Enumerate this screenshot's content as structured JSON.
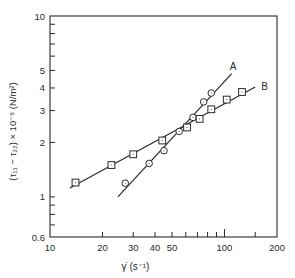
{
  "chart_data": {
    "type": "line",
    "title": "",
    "xlabel": "γ̇ (s⁻¹)",
    "ylabel": "(τ₁₁ − τ₂₂) × 10⁻⁵ (N/m²)",
    "xscale": "log",
    "yscale": "log",
    "xlim": [
      10,
      200
    ],
    "ylim": [
      0.6,
      10
    ],
    "grid": false,
    "legend": "inline labels at line ends",
    "x_ticks": [
      {
        "value": 10,
        "label": "10"
      },
      {
        "value": 20,
        "label": "20"
      },
      {
        "value": 30,
        "label": "30"
      },
      {
        "value": 40,
        "label": "40"
      },
      {
        "value": 50,
        "label": "50"
      },
      {
        "value": 100,
        "label": "100"
      },
      {
        "value": 200,
        "label": "200"
      }
    ],
    "x_minor_ticks": [
      60,
      70,
      80,
      90,
      150
    ],
    "y_ticks": [
      {
        "value": 0.6,
        "label": "0.6"
      },
      {
        "value": 1,
        "label": "1"
      },
      {
        "value": 2,
        "label": "2"
      },
      {
        "value": 3,
        "label": "3"
      },
      {
        "value": 4,
        "label": "4"
      },
      {
        "value": 5,
        "label": "5"
      },
      {
        "value": 10,
        "label": "10"
      }
    ],
    "y_minor_ticks": [
      0.7,
      0.8,
      0.9,
      6,
      7,
      8,
      9
    ],
    "series": [
      {
        "name": "A",
        "marker": "circle",
        "x": [
          27,
          37,
          45,
          55,
          66,
          76,
          84
        ],
        "y": [
          1.19,
          1.53,
          1.8,
          2.3,
          2.75,
          3.35,
          3.75
        ],
        "fit_line": {
          "x": [
            24.5,
            110
          ],
          "y": [
            1.0,
            4.8
          ]
        }
      },
      {
        "name": "B",
        "marker": "square",
        "x": [
          14,
          22.5,
          30,
          44,
          61,
          72,
          84,
          103,
          126
        ],
        "y": [
          1.2,
          1.5,
          1.72,
          2.05,
          2.42,
          2.7,
          3.05,
          3.45,
          3.8
        ],
        "fit_line": {
          "x": [
            13,
            150
          ],
          "y": [
            1.12,
            4.05
          ]
        }
      }
    ]
  },
  "labels": {
    "series_a": "A",
    "series_b": "B",
    "x_axis": "γ̇ (s⁻¹)"
  }
}
